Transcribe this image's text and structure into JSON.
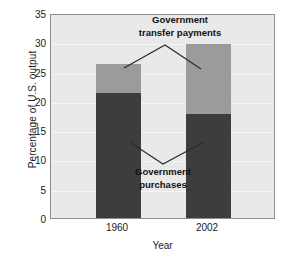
{
  "chart_data": {
    "type": "bar",
    "stacked": true,
    "title": "",
    "xlabel": "Year",
    "ylabel": "Percentage of U.S. output",
    "categories": [
      "1960",
      "2002"
    ],
    "ylim": [
      0,
      35
    ],
    "yticks": [
      0,
      5,
      10,
      15,
      20,
      25,
      30,
      35
    ],
    "ytick_labels": [
      "0",
      "5",
      "10",
      "15",
      "20",
      "25",
      "30",
      "35"
    ],
    "grid": true,
    "legend_position": "annotations-on-plot",
    "series": [
      {
        "name": "Government purchases",
        "color": "#3d3d3d",
        "values": [
          21.5,
          18.0
        ]
      },
      {
        "name": "Government transfer payments",
        "color": "#9b9b9b",
        "values": [
          5.0,
          12.0
        ]
      }
    ],
    "totals": [
      26.5,
      30.0
    ],
    "annotations": [
      {
        "name": "transfers-annotation",
        "line1": "Government",
        "line2": "transfer payments"
      },
      {
        "name": "purchases-annotation",
        "line1": "Government",
        "line2": "purchases"
      }
    ]
  },
  "style": {
    "plot_background": "#e9e9e9",
    "plot_border": "#8e8e8e",
    "gridline_color": "#f6f6f6",
    "text_color": "#1a1a1a",
    "annotation_color": "#111111",
    "leader_color": "#2a2a2a"
  }
}
